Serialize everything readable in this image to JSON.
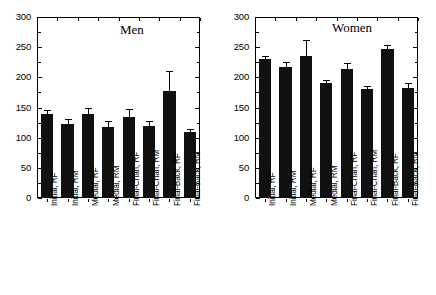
{
  "chart_data": [
    {
      "type": "bar",
      "title": "Men",
      "panel": "left",
      "xlabel": "",
      "ylabel": "",
      "ylim": [
        0,
        300
      ],
      "yticks": [
        0,
        50,
        100,
        150,
        200,
        250,
        300
      ],
      "ytick_labels": [
        "0",
        "50",
        "100",
        "150",
        "200",
        "250",
        "300"
      ],
      "grid": false,
      "legend": "none",
      "categories": [
        "Initial, RF",
        "Initial, RM",
        "Medial, RF",
        "Medial, RM",
        "Final-Chan, RF",
        "Final-Chan, RM",
        "Final-Back, RF",
        "Final-Back, RM"
      ],
      "values": [
        139,
        122,
        139,
        118,
        135,
        120,
        178,
        109
      ],
      "errors": [
        7,
        9,
        11,
        10,
        12,
        8,
        33,
        6
      ]
    },
    {
      "type": "bar",
      "title": "Women",
      "panel": "right",
      "xlabel": "",
      "ylabel": "",
      "ylim": [
        0,
        300
      ],
      "yticks": [
        0,
        50,
        100,
        150,
        200,
        250,
        300
      ],
      "ytick_labels": [
        "0",
        "50",
        "100",
        "150",
        "200",
        "250",
        "300"
      ],
      "grid": false,
      "legend": "none",
      "categories": [
        "Initial, RF",
        "Initial, RM",
        "Medial, RF",
        "Medial, RM",
        "Final-Chan, RF",
        "Final-Chan, RM",
        "Final-Back, RF",
        "Final-Back, RM"
      ],
      "values": [
        230,
        217,
        236,
        190,
        213,
        181,
        247,
        183
      ],
      "errors": [
        6,
        8,
        26,
        5,
        11,
        5,
        7,
        8
      ]
    }
  ],
  "colors": {
    "bar_fill": "#101010",
    "axis": "#000000",
    "background": "#ffffff"
  }
}
